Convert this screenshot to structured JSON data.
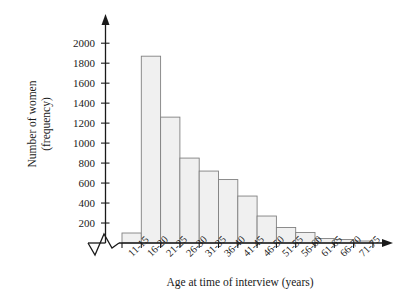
{
  "chart_data": {
    "type": "bar",
    "title": "",
    "xlabel": "Age at time of interview (years)",
    "ylabel": "Number of women\n(frequency)",
    "categories": [
      "11-15",
      "16-20",
      "21-25",
      "26-30",
      "31-35",
      "36-40",
      "41-45",
      "46-50",
      "51-55",
      "56-60",
      "61-65",
      "66-70",
      "71-75"
    ],
    "values": [
      100,
      1870,
      1260,
      850,
      720,
      635,
      470,
      270,
      155,
      105,
      45,
      35,
      20
    ],
    "ylim": [
      0,
      2100
    ],
    "yticks": [
      200,
      400,
      600,
      800,
      1000,
      1200,
      1400,
      1600,
      1800,
      2000
    ],
    "ytick_labels": [
      "200",
      "400",
      "600",
      "800",
      "1000",
      "1200",
      "1400",
      "1600",
      "1800",
      "2000"
    ],
    "grid": false,
    "legend": null,
    "axis_break": "x-axis broken near origin (zigzag)",
    "bar_fill": "#f0f0f0",
    "bar_edge": "#808080",
    "axis_color": "#1a1a1a"
  }
}
